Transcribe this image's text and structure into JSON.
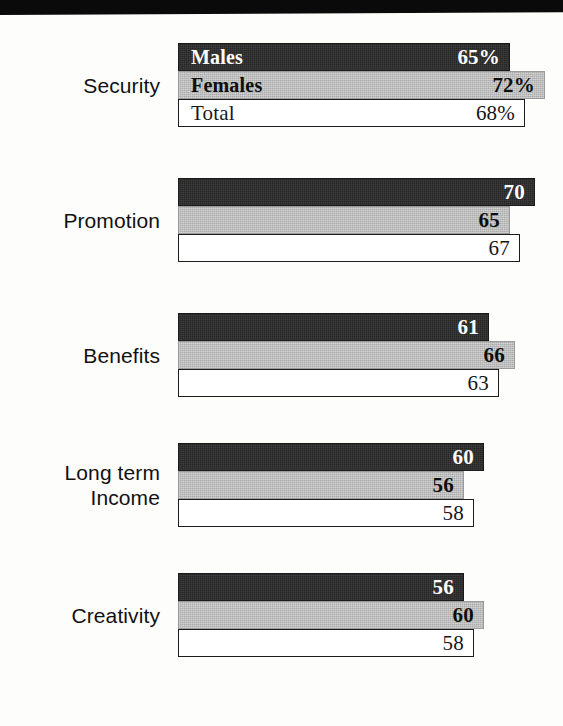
{
  "chart_data": {
    "type": "bar",
    "orientation": "horizontal",
    "title": "",
    "subtitle": "",
    "xlabel": "",
    "ylabel": "",
    "grid": false,
    "legend_position": "in-bars-first-group",
    "value_suffix_first_group": "%",
    "axis_origin_px": 178,
    "px_per_unit": 5.1,
    "categories": [
      "Security",
      "Promotion",
      "Benefits",
      "Long term\nIncome",
      "Creativity"
    ],
    "series": [
      {
        "name": "Males",
        "style": "dark",
        "values": [
          65,
          70,
          61,
          60,
          56
        ]
      },
      {
        "name": "Females",
        "style": "gray",
        "values": [
          72,
          65,
          66,
          56,
          60
        ]
      },
      {
        "name": "Total",
        "style": "white",
        "values": [
          68,
          67,
          63,
          58,
          58
        ]
      }
    ]
  },
  "groups": [
    {
      "label_line1": "Security",
      "label_line2": "",
      "rows": [
        {
          "series": "Males",
          "label": "Males",
          "value": 65,
          "display": "65%",
          "style": "dark",
          "show_series_label": true
        },
        {
          "series": "Females",
          "label": "Females",
          "value": 72,
          "display": "72%",
          "style": "gray",
          "show_series_label": true
        },
        {
          "series": "Total",
          "label": "Total",
          "value": 68,
          "display": "68%",
          "style": "white",
          "show_series_label": true
        }
      ]
    },
    {
      "label_line1": "Promotion",
      "label_line2": "",
      "rows": [
        {
          "series": "Males",
          "label": "Males",
          "value": 70,
          "display": "70",
          "style": "dark",
          "show_series_label": false
        },
        {
          "series": "Females",
          "label": "Females",
          "value": 65,
          "display": "65",
          "style": "gray",
          "show_series_label": false
        },
        {
          "series": "Total",
          "label": "Total",
          "value": 67,
          "display": "67",
          "style": "white",
          "show_series_label": false
        }
      ]
    },
    {
      "label_line1": "Benefits",
      "label_line2": "",
      "rows": [
        {
          "series": "Males",
          "label": "Males",
          "value": 61,
          "display": "61",
          "style": "dark",
          "show_series_label": false
        },
        {
          "series": "Females",
          "label": "Females",
          "value": 66,
          "display": "66",
          "style": "gray",
          "show_series_label": false
        },
        {
          "series": "Total",
          "label": "Total",
          "value": 63,
          "display": "63",
          "style": "white",
          "show_series_label": false
        }
      ]
    },
    {
      "label_line1": "Long term",
      "label_line2": "Income",
      "rows": [
        {
          "series": "Males",
          "label": "Males",
          "value": 60,
          "display": "60",
          "style": "dark",
          "show_series_label": false
        },
        {
          "series": "Females",
          "label": "Females",
          "value": 56,
          "display": "56",
          "style": "gray",
          "show_series_label": false
        },
        {
          "series": "Total",
          "label": "Total",
          "value": 58,
          "display": "58",
          "style": "white",
          "show_series_label": false
        }
      ]
    },
    {
      "label_line1": "Creativity",
      "label_line2": "",
      "rows": [
        {
          "series": "Males",
          "label": "Males",
          "value": 56,
          "display": "56",
          "style": "dark",
          "show_series_label": false
        },
        {
          "series": "Females",
          "label": "Females",
          "value": 60,
          "display": "60",
          "style": "gray",
          "show_series_label": false
        },
        {
          "series": "Total",
          "label": "Total",
          "value": 58,
          "display": "58",
          "style": "white",
          "show_series_label": false
        }
      ]
    }
  ],
  "colors": {
    "dark_bar": "#262626",
    "gray_bar": "#ababab",
    "white_bar": "#ffffff",
    "outline": "#1d1d1d",
    "background": "#fdfdfc",
    "top_band": "#0a0a0a"
  }
}
